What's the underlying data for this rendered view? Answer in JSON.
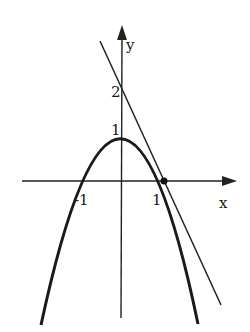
{
  "figure": {
    "axes": {
      "x_label": "x",
      "y_label": "y"
    },
    "tick_labels": {
      "x_neg_one": "-1",
      "x_one": "1",
      "y_one": "1",
      "y_two": "2"
    },
    "curves": [
      {
        "name": "parabola",
        "equation": "y = 1 - x^2",
        "vertex": [
          0,
          1
        ],
        "x_intercepts": [
          -1,
          1
        ]
      },
      {
        "name": "tangent-line",
        "equation": "y = -2x + 2",
        "y_intercept": 2,
        "tangent_point": [
          1,
          0
        ]
      }
    ],
    "marked_point": [
      1,
      0
    ],
    "colors": {
      "stroke": "#1a1a1a",
      "background": "#ffffff"
    }
  }
}
